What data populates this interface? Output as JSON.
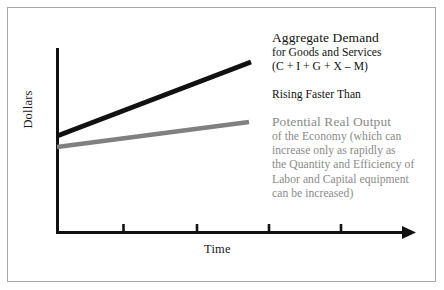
{
  "figure": {
    "type": "line",
    "axes": {
      "ylabel": "Dollars",
      "xlabel": "Time"
    },
    "annotations": {
      "aggregate_demand": {
        "heading": "Aggregate Demand",
        "lines": [
          "for Goods and Services",
          "(C + I + G + X – M)"
        ],
        "color": "#111111"
      },
      "comparison": {
        "text": "Rising Faster Than",
        "color": "#111111"
      },
      "potential_output": {
        "heading": "Potential Real Output",
        "lines": [
          "of the Economy (which can",
          "increase only as rapidly as",
          "the Quantity and Efficiency of",
          "Labor and Capital equipment",
          "can be increased)"
        ],
        "color": "#8a8a8a"
      }
    },
    "series": [
      {
        "name": "Aggregate Demand",
        "color": "#111111",
        "x": [
          0,
          1
        ],
        "y": [
          0.52,
          1.0
        ]
      },
      {
        "name": "Potential Real Output",
        "color": "#808080",
        "x": [
          0,
          1
        ],
        "y": [
          0.4,
          0.62
        ]
      }
    ],
    "xticks_count": 4,
    "grid": false,
    "legend": "none"
  },
  "icons": {
    "x_axis_arrow": "arrow-right-icon"
  }
}
